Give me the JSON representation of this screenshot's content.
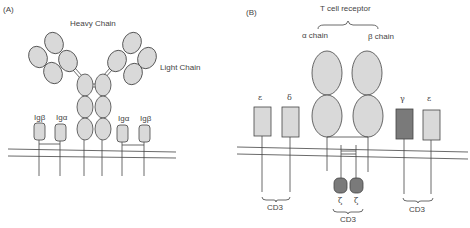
{
  "panel_a": {
    "tag": "(A)",
    "heavy_chain_label": "Heavy Chain",
    "light_chain_label": "Light Chain",
    "ig_labels": [
      "Igβ",
      "Igα",
      "Igα",
      "Igβ"
    ]
  },
  "panel_b": {
    "tag": "(B)",
    "title": "T cell receptor",
    "alpha_label": "α chain",
    "beta_label": "β chain",
    "left_subunits": [
      "ε",
      "δ"
    ],
    "right_subunits": [
      "γ",
      "ε"
    ],
    "zeta_labels": [
      "ζ",
      "ζ"
    ],
    "cd3_labels": [
      "CD3",
      "CD3",
      "CD3"
    ]
  },
  "colors": {
    "fill_light": "#d9d9d9",
    "fill_dark": "#7a7a7a",
    "stroke": "#444444"
  }
}
